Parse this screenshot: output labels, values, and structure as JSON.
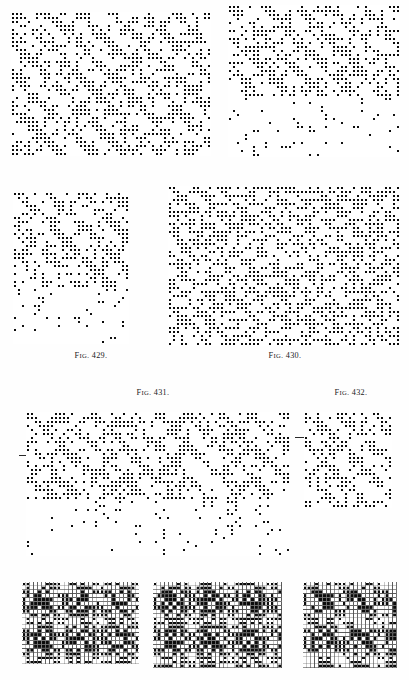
{
  "page": {
    "kind": "weave-design-plate",
    "width": 409,
    "height": 680,
    "background_color": "#ffffff",
    "ink_color": "#000000",
    "paper_tone": "#fefefe"
  },
  "captions": [
    {
      "id": "fig-429",
      "prefix": "Fig.",
      "number": "429.",
      "text": "Fig. 429.",
      "x": 46,
      "y": 351,
      "width": 90,
      "align": "center"
    },
    {
      "id": "fig-430",
      "prefix": "Fig.",
      "number": "430.",
      "text": "Fig. 430.",
      "x": 240,
      "y": 351,
      "width": 90,
      "align": "center"
    },
    {
      "id": "fig-431",
      "prefix": "Fig.",
      "number": "431.",
      "text": "Fig. 431.",
      "x": 108,
      "y": 388,
      "width": 90,
      "align": "center"
    },
    {
      "id": "fig-432",
      "prefix": "Fig.",
      "number": "432.",
      "text": "Fig. 432.",
      "x": 306,
      "y": 388,
      "width": 90,
      "align": "center"
    }
  ],
  "tick_marks": [
    {
      "id": "tick-fig-431-left",
      "x": 19,
      "y": 455,
      "width": 7
    },
    {
      "id": "tick-fig-432-left",
      "x": 295,
      "y": 437,
      "width": 9
    }
  ],
  "figures": [
    {
      "id": "figure-top-left",
      "label": "unnumbered-design-upper-left",
      "x": 11,
      "y": 12,
      "cols": 50,
      "rows": 36,
      "cell": 4.0,
      "sections": [
        {
          "name": "design-area",
          "rows": 36,
          "style": "filled",
          "seed": 4291,
          "motif": "broken-twill-diamond",
          "period_x": 8,
          "period_y": 8,
          "density": 0.42,
          "slope": -1
        }
      ]
    },
    {
      "id": "figure-top-right",
      "label": "unnumbered-design-upper-right",
      "x": 228,
      "y": 5,
      "cols": 43,
      "rows": 38,
      "cell": 4.0,
      "sections": [
        {
          "name": "design-area",
          "rows": 23,
          "style": "filled",
          "seed": 7717,
          "motif": "broken-twill-diamond",
          "period_x": 8,
          "period_y": 8,
          "density": 0.4,
          "slope": -1
        },
        {
          "name": "peg-plan",
          "rows": 15,
          "style": "sparse-cross",
          "seed": 3331,
          "motif": "sparse-marks",
          "period_x": 8,
          "period_y": 8,
          "density": 0.045,
          "slope": -1
        }
      ]
    },
    {
      "id": "figure-429",
      "label": "Fig. 429",
      "x": 13,
      "y": 192,
      "cols": 29,
      "rows": 38,
      "cell": 4.0,
      "sections": [
        {
          "name": "design-area",
          "rows": 24,
          "style": "filled",
          "seed": 5153,
          "motif": "broken-twill-diamond",
          "period_x": 8,
          "period_y": 8,
          "density": 0.41,
          "slope": -1
        },
        {
          "name": "peg-plan",
          "rows": 14,
          "style": "sparse-cross",
          "seed": 9091,
          "motif": "sparse-marks",
          "period_x": 8,
          "period_y": 8,
          "density": 0.055,
          "slope": -1
        }
      ]
    },
    {
      "id": "figure-430",
      "label": "Fig. 430",
      "x": 168,
      "y": 186,
      "cols": 58,
      "rows": 40,
      "cell": 4.0,
      "sections": [
        {
          "name": "design-area",
          "rows": 40,
          "style": "filled",
          "seed": 2609,
          "motif": "scattered-twill",
          "period_x": 6,
          "period_y": 6,
          "density": 0.44,
          "slope": -1
        }
      ]
    },
    {
      "id": "figure-431",
      "label": "Fig. 431",
      "x": 26,
      "y": 412,
      "cols": 66,
      "rows": 36,
      "cell": 4.0,
      "sections": [
        {
          "name": "design-area",
          "rows": 22,
          "style": "filled",
          "seed": 8123,
          "motif": "zigzag-twill",
          "period_x": 8,
          "period_y": 8,
          "density": 0.4,
          "slope": -1
        },
        {
          "name": "peg-plan",
          "rows": 14,
          "style": "sparse-cross",
          "seed": 6067,
          "motif": "sparse-marks",
          "period_x": 8,
          "period_y": 8,
          "density": 0.04,
          "slope": -1
        }
      ]
    },
    {
      "id": "figure-432",
      "label": "Fig. 432",
      "x": 304,
      "y": 412,
      "cols": 22,
      "rows": 24,
      "cell": 4.0,
      "sections": [
        {
          "name": "design-area",
          "rows": 24,
          "style": "filled",
          "seed": 1471,
          "motif": "broken-twill-diamond",
          "period_x": 8,
          "period_y": 8,
          "density": 0.43,
          "slope": -1
        }
      ]
    },
    {
      "id": "figure-bottom-left",
      "label": "unnumbered-design-lower-left",
      "x": 22,
      "y": 582,
      "cols": 30,
      "rows": 21,
      "cell": 3.9,
      "sections": [
        {
          "name": "design-area",
          "rows": 21,
          "style": "filled",
          "seed": 3607,
          "motif": "scattered-twill",
          "period_x": 6,
          "period_y": 6,
          "density": 0.45,
          "slope": -1
        }
      ]
    },
    {
      "id": "figure-bottom-center",
      "label": "unnumbered-design-lower-center",
      "x": 153,
      "y": 582,
      "cols": 33,
      "rows": 22,
      "cell": 3.9,
      "sections": [
        {
          "name": "design-area",
          "rows": 22,
          "style": "filled",
          "seed": 5849,
          "motif": "scattered-twill",
          "period_x": 6,
          "period_y": 6,
          "density": 0.46,
          "slope": -1
        }
      ]
    },
    {
      "id": "figure-bottom-right",
      "label": "unnumbered-design-lower-right",
      "x": 303,
      "y": 582,
      "cols": 24,
      "rows": 22,
      "cell": 3.9,
      "sections": [
        {
          "name": "design-area",
          "rows": 22,
          "style": "filled",
          "seed": 9277,
          "motif": "broken-twill-diamond",
          "period_x": 8,
          "period_y": 8,
          "density": 0.42,
          "slope": -1
        }
      ]
    }
  ],
  "legend": {
    "filled_cell": "black square — warp up / raised end",
    "empty_cell": "open square — weft up / sunken end",
    "cross_cell": "× mark — peg plan / lifting-plan indication"
  }
}
